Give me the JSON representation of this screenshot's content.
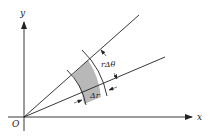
{
  "diagram": {
    "colors": {
      "stroke": "#222222",
      "shade": "#b8b8b8",
      "background": "#ffffff"
    },
    "labels": {
      "origin": "O",
      "x_axis": "x",
      "y_axis": "y",
      "arc_length": "rΔθ",
      "radial_increment": "Δr"
    }
  }
}
